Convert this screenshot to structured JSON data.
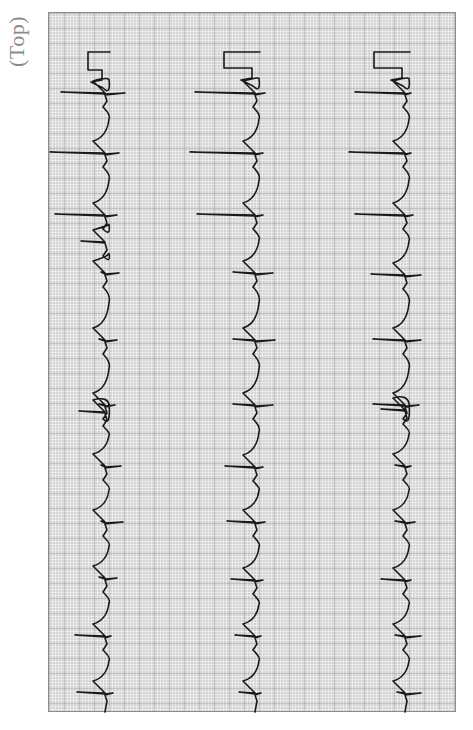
{
  "label": {
    "orientation_text": "(Top)"
  },
  "strip": {
    "grid_color": "#d4d4d4",
    "trace_color": "#1a1a1a",
    "traces": [
      {
        "name": "left",
        "baseline_x": 105,
        "calibration": {
          "top_y": 52,
          "bottom_y": 80,
          "left_x": 88,
          "right_x": 102
        },
        "spikes": [
          {
            "y": 93,
            "left": 44,
            "right": 20
          },
          {
            "y": 153,
            "left": 55,
            "right": 14
          },
          {
            "y": 215,
            "left": 50,
            "right": 12
          },
          {
            "y": 242,
            "left": 24,
            "right": 0
          },
          {
            "y": 273,
            "left": 4,
            "right": 14
          },
          {
            "y": 340,
            "left": 6,
            "right": 12
          },
          {
            "y": 405,
            "left": 6,
            "right": 10
          },
          {
            "y": 412,
            "left": 26,
            "right": 0
          },
          {
            "y": 466,
            "left": 4,
            "right": 16
          },
          {
            "y": 522,
            "left": 4,
            "right": 18
          },
          {
            "y": 578,
            "left": 6,
            "right": 12
          },
          {
            "y": 636,
            "left": 30,
            "right": 6
          },
          {
            "y": 693,
            "left": 28,
            "right": 8
          }
        ]
      },
      {
        "name": "middle",
        "baseline_x": 255,
        "calibration": {
          "top_y": 52,
          "bottom_y": 78,
          "left_x": 224,
          "right_x": 252
        },
        "spikes": [
          {
            "y": 93,
            "left": 60,
            "right": 10
          },
          {
            "y": 153,
            "left": 65,
            "right": 8
          },
          {
            "y": 215,
            "left": 58,
            "right": 8
          },
          {
            "y": 273,
            "left": 22,
            "right": 18
          },
          {
            "y": 340,
            "left": 22,
            "right": 20
          },
          {
            "y": 405,
            "left": 22,
            "right": 18
          },
          {
            "y": 467,
            "left": 30,
            "right": 8
          },
          {
            "y": 522,
            "left": 28,
            "right": 10
          },
          {
            "y": 580,
            "left": 24,
            "right": 8
          },
          {
            "y": 636,
            "left": 20,
            "right": 6
          },
          {
            "y": 693,
            "left": 16,
            "right": 6
          }
        ]
      },
      {
        "name": "right",
        "baseline_x": 405,
        "calibration": {
          "top_y": 52,
          "bottom_y": 78,
          "left_x": 374,
          "right_x": 402
        },
        "spikes": [
          {
            "y": 93,
            "left": 50,
            "right": 6
          },
          {
            "y": 153,
            "left": 56,
            "right": 6
          },
          {
            "y": 215,
            "left": 50,
            "right": 8
          },
          {
            "y": 275,
            "left": 34,
            "right": 16
          },
          {
            "y": 340,
            "left": 32,
            "right": 16
          },
          {
            "y": 405,
            "left": 32,
            "right": 14
          },
          {
            "y": 410,
            "left": 24,
            "right": 0
          },
          {
            "y": 466,
            "left": 10,
            "right": 6
          },
          {
            "y": 522,
            "left": 10,
            "right": 10
          },
          {
            "y": 580,
            "left": 24,
            "right": 6
          },
          {
            "y": 636,
            "left": 10,
            "right": 16
          },
          {
            "y": 693,
            "left": 8,
            "right": 16
          }
        ]
      }
    ]
  }
}
